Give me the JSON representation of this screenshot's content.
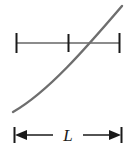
{
  "figure": {
    "title": "",
    "background_color": "#ffffff",
    "curve": {
      "name": "rising-curve",
      "color": "#6e6e6e",
      "stroke_width": 2.4,
      "start": [
        13,
        112
      ],
      "end": [
        122,
        6
      ],
      "control_points": [
        [
          48,
          92
        ],
        [
          86,
          48
        ]
      ],
      "description": "monotonically increasing concave-up curve"
    },
    "scale_bar": {
      "name": "horizontal-scale-bar",
      "color": "#8c8c8c",
      "tick_color": "#1a1a1a",
      "line_y": 43,
      "x_start": 16,
      "x_end": 120,
      "tick_top": 33,
      "tick_bottom": 53,
      "ticks": [
        16,
        68,
        120
      ],
      "tick_labels": [
        "",
        "",
        ""
      ]
    },
    "dimension": {
      "name": "length-dimension",
      "label": "L",
      "color": "#1a1a1a",
      "line_y": 135,
      "x_start": 14,
      "x_end": 122,
      "cap_top": 127,
      "cap_bottom": 143,
      "arrow_direction": "both"
    }
  }
}
